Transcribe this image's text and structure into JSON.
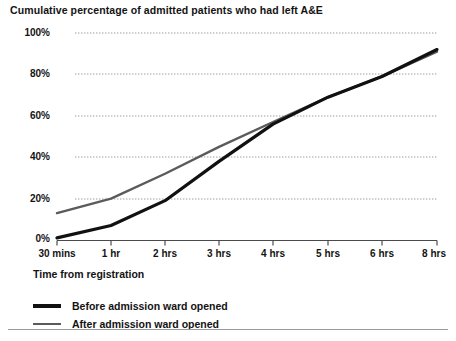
{
  "chart": {
    "title": "Cumulative percentage of admitted patients who had left A&E",
    "xlabel": "Time from registration",
    "ylabel": ""
  },
  "legend": {
    "items": [
      {
        "label": "Before admission ward opened",
        "color": "#111111"
      },
      {
        "label": "After admission ward opened",
        "color": "#5b5b5b"
      }
    ]
  },
  "axes": {
    "yticks": [
      "0%",
      "20%",
      "40%",
      "60%",
      "80%",
      "100%"
    ],
    "xticks": [
      "30 mins",
      "1 hr",
      "2 hrs",
      "3 hrs",
      "4 hrs",
      "5 hrs",
      "6 hrs",
      "8 hrs"
    ]
  },
  "chart_data": {
    "type": "line",
    "title": "Cumulative percentage of admitted patients who had left A&E",
    "xlabel": "Time from registration",
    "ylabel": "",
    "categories": [
      "30 mins",
      "1 hr",
      "2 hrs",
      "3 hrs",
      "4 hrs",
      "5 hrs",
      "6 hrs",
      "8 hrs"
    ],
    "series": [
      {
        "name": "Before admission ward opened",
        "color": "#111111",
        "values": [
          1,
          7,
          19,
          38,
          56,
          69,
          79,
          92
        ]
      },
      {
        "name": "After admission ward opened",
        "color": "#5b5b5b",
        "values": [
          13,
          20,
          32,
          45,
          57,
          69,
          79,
          91
        ]
      }
    ],
    "ylim": [
      0,
      100
    ],
    "ytick_values": [
      0,
      20,
      40,
      60,
      80,
      100
    ],
    "grid": true,
    "grid_style": "dotted-horizontal",
    "legend_position": "below-axes"
  }
}
